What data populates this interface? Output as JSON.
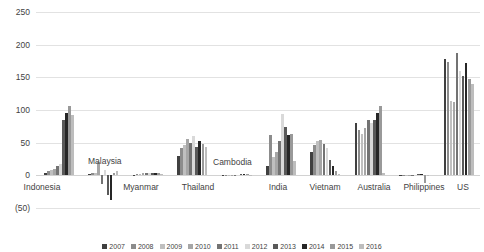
{
  "chart_data": {
    "type": "bar",
    "title": "",
    "subtitle": "",
    "xlabel": "",
    "ylabel": "",
    "ylim": [
      -50,
      250
    ],
    "yticks": [
      250,
      200,
      150,
      100,
      50,
      0,
      -50
    ],
    "ytick_labels": [
      "250",
      "200",
      "150",
      "100",
      "50",
      "0",
      "(50)"
    ],
    "grid": true,
    "legend_position": "bottom",
    "categories": [
      "Indonesia",
      "Malaysia",
      "Myanmar",
      "Thailand",
      "Cambodia",
      "India",
      "Vietnam",
      "Australia",
      "Philippines",
      "US"
    ],
    "series": [
      {
        "name": "2007",
        "color": "#404040",
        "values": [
          4,
          2,
          1,
          30,
          0,
          14,
          36,
          80,
          1,
          178
        ]
      },
      {
        "name": "2008",
        "color": "#8c8c8c",
        "values": [
          6,
          4,
          2,
          42,
          0,
          62,
          46,
          70,
          1,
          174
        ]
      },
      {
        "name": "2009",
        "color": "#bfbfbf",
        "values": [
          8,
          3,
          2,
          46,
          0,
          28,
          52,
          64,
          1,
          114
        ]
      },
      {
        "name": "2010",
        "color": "#a6a6a6",
        "values": [
          10,
          20,
          3,
          56,
          1,
          36,
          54,
          72,
          1,
          112
        ]
      },
      {
        "name": "2011",
        "color": "#737373",
        "values": [
          14,
          -14,
          4,
          50,
          1,
          52,
          48,
          84,
          1,
          188
        ]
      },
      {
        "name": "2012",
        "color": "#d9d9d9",
        "values": [
          18,
          8,
          4,
          60,
          1,
          94,
          42,
          80,
          1,
          160
        ]
      },
      {
        "name": "2013",
        "color": "#595959",
        "values": [
          84,
          -30,
          3,
          44,
          2,
          74,
          24,
          84,
          2,
          152
        ]
      },
      {
        "name": "2014",
        "color": "#262626",
        "values": [
          96,
          -38,
          4,
          52,
          2,
          62,
          14,
          96,
          2,
          172
        ]
      },
      {
        "name": "2015",
        "color": "#999999",
        "values": [
          106,
          4,
          3,
          48,
          2,
          64,
          6,
          106,
          -12,
          148
        ]
      },
      {
        "name": "2016",
        "color": "#bdbdbd",
        "values": [
          92,
          6,
          2,
          44,
          1,
          22,
          2,
          4,
          1,
          140
        ]
      }
    ],
    "inline_labels": [
      {
        "text": "Malaysia",
        "x": 88,
        "y": 157
      },
      {
        "text": "Cambodia",
        "x": 213,
        "y": 158
      }
    ],
    "axis_labels": [
      {
        "text": "Indonesia",
        "center": 42
      },
      {
        "text": "Myanmar",
        "center": 141
      },
      {
        "text": "Thailand",
        "center": 198
      },
      {
        "text": "India",
        "center": 278
      },
      {
        "text": "Vietnam",
        "center": 325
      },
      {
        "text": "Australia",
        "center": 374
      },
      {
        "text": "Philippines",
        "center": 424
      },
      {
        "text": "US",
        "center": 463
      }
    ]
  }
}
